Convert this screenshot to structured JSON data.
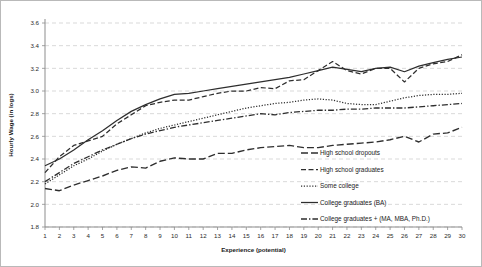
{
  "chart_data": {
    "type": "line",
    "title": "",
    "xlabel": "Experience (potential)",
    "ylabel": "Hourly Wage (in logs)",
    "xlim": [
      1,
      30
    ],
    "ylim": [
      1.8,
      3.6
    ],
    "ytick_step": 0.2,
    "grid": true,
    "grid_axis": "y",
    "legend_position": "right-inside",
    "xticks": [
      1,
      2,
      3,
      4,
      5,
      6,
      7,
      8,
      9,
      10,
      11,
      12,
      13,
      14,
      15,
      16,
      17,
      18,
      19,
      20,
      21,
      22,
      23,
      24,
      25,
      26,
      27,
      28,
      29,
      30
    ],
    "yticks": [
      1.8,
      2.0,
      2.2,
      2.4,
      2.6,
      2.8,
      3.0,
      3.2,
      3.4,
      3.6
    ],
    "x": [
      1,
      2,
      3,
      4,
      5,
      6,
      7,
      8,
      9,
      10,
      11,
      12,
      13,
      14,
      15,
      16,
      17,
      18,
      19,
      20,
      21,
      22,
      23,
      24,
      25,
      26,
      27,
      28,
      29,
      30
    ],
    "series": [
      {
        "name": "High school dropouts",
        "dash": "long-dash",
        "values": [
          2.14,
          2.12,
          2.17,
          2.21,
          2.25,
          2.3,
          2.33,
          2.32,
          2.38,
          2.41,
          2.4,
          2.4,
          2.45,
          2.45,
          2.48,
          2.5,
          2.51,
          2.52,
          2.5,
          2.5,
          2.52,
          2.53,
          2.54,
          2.55,
          2.57,
          2.6,
          2.55,
          2.62,
          2.63,
          2.68
        ]
      },
      {
        "name": "High school graduates",
        "dash": "dash",
        "values": [
          2.28,
          2.42,
          2.52,
          2.56,
          2.6,
          2.71,
          2.79,
          2.87,
          2.9,
          2.92,
          2.92,
          2.95,
          2.98,
          3.0,
          3.0,
          3.03,
          3.02,
          3.09,
          3.1,
          3.18,
          3.26,
          3.18,
          3.15,
          3.2,
          3.2,
          3.08,
          3.2,
          3.24,
          3.26,
          3.32
        ]
      },
      {
        "name": "Some college",
        "dash": "dot",
        "values": [
          2.18,
          2.26,
          2.34,
          2.4,
          2.47,
          2.53,
          2.58,
          2.63,
          2.67,
          2.7,
          2.73,
          2.76,
          2.79,
          2.82,
          2.85,
          2.87,
          2.89,
          2.9,
          2.92,
          2.93,
          2.92,
          2.89,
          2.88,
          2.88,
          2.91,
          2.94,
          2.96,
          2.97,
          2.97,
          2.98
        ]
      },
      {
        "name": "College graduates (BA)",
        "dash": "solid",
        "values": [
          2.34,
          2.4,
          2.48,
          2.57,
          2.65,
          2.74,
          2.82,
          2.88,
          2.93,
          2.97,
          2.98,
          3.0,
          3.02,
          3.04,
          3.06,
          3.08,
          3.1,
          3.12,
          3.15,
          3.18,
          3.21,
          3.19,
          3.17,
          3.2,
          3.21,
          3.17,
          3.22,
          3.25,
          3.28,
          3.3
        ]
      },
      {
        "name": "College graduates + (MA, MBA, Ph.D.)",
        "dash": "dash-dot",
        "values": [
          2.2,
          2.28,
          2.36,
          2.42,
          2.48,
          2.53,
          2.58,
          2.62,
          2.65,
          2.68,
          2.7,
          2.72,
          2.74,
          2.76,
          2.78,
          2.8,
          2.79,
          2.81,
          2.82,
          2.83,
          2.83,
          2.84,
          2.84,
          2.85,
          2.85,
          2.85,
          2.86,
          2.87,
          2.88,
          2.89
        ]
      }
    ]
  },
  "legend": {
    "items": [
      {
        "label": "High school dropouts"
      },
      {
        "label": "High school graduates"
      },
      {
        "label": "Some college"
      },
      {
        "label": "College graduates (BA)"
      },
      {
        "label": "College graduates + (MA, MBA, Ph.D.)"
      }
    ]
  }
}
